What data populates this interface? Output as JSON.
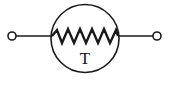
{
  "diagram": {
    "component": "thermistor",
    "label": "T",
    "colors": {
      "stroke": "#1a1a1a",
      "background": "#ffffff"
    },
    "elements": [
      {
        "type": "terminal",
        "side": "left"
      },
      {
        "type": "wire",
        "side": "left"
      },
      {
        "type": "body-circle"
      },
      {
        "type": "resistor-zigzag"
      },
      {
        "type": "wire",
        "side": "right"
      },
      {
        "type": "terminal",
        "side": "right"
      }
    ]
  }
}
